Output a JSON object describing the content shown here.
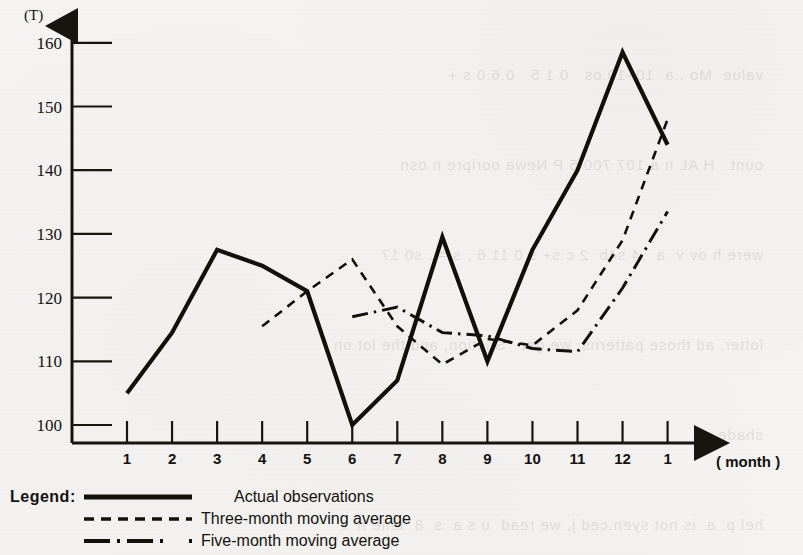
{
  "chart_data": {
    "type": "line",
    "title": "",
    "unit_label": "(T)",
    "xlabel": "( month )",
    "ylabel": "",
    "ylim": [
      95,
      165
    ],
    "yticks": [
      100,
      110,
      120,
      130,
      140,
      150,
      160
    ],
    "grid": false,
    "x": [
      1,
      2,
      3,
      4,
      5,
      6,
      7,
      8,
      9,
      10,
      11,
      12,
      13
    ],
    "categories": [
      "1",
      "2",
      "3",
      "4",
      "5",
      "6",
      "7",
      "8",
      "9",
      "10",
      "11",
      "12",
      "1"
    ],
    "year_markers": [
      {
        "at_category_index": 0,
        "label": "2020"
      },
      {
        "at_category_index": 12,
        "label": "2021"
      }
    ],
    "legend_position": "below-left",
    "legend_title": "Legend:",
    "series": [
      {
        "name": "Actual observations",
        "style": "solid",
        "x": [
          1,
          2,
          3,
          4,
          5,
          6,
          7,
          8,
          9,
          10,
          11,
          12,
          13
        ],
        "values": [
          105,
          114.5,
          127.5,
          125,
          121,
          100,
          107,
          129.5,
          110,
          127.5,
          140,
          158.5,
          144
        ]
      },
      {
        "name": "Three-month moving average",
        "style": "dashed",
        "x": [
          4,
          5,
          6,
          7,
          8,
          9,
          10,
          11,
          12,
          13
        ],
        "values": [
          115.5,
          121,
          126,
          115.5,
          109.5,
          113.5,
          112.5,
          118,
          129,
          148
        ]
      },
      {
        "name": "Five-month moving average",
        "style": "dash-dot",
        "x": [
          6,
          7,
          8,
          9,
          10,
          11,
          12,
          13
        ],
        "values": [
          117,
          118.5,
          114.5,
          114,
          112,
          111.5,
          121.5,
          133.5
        ]
      }
    ]
  },
  "axis": {
    "unit": "(T)",
    "x_caption": "( month )",
    "y_tick_labels": [
      "160",
      "150",
      "140",
      "130",
      "120",
      "110",
      "100"
    ],
    "x_tick_labels": [
      "1",
      "2",
      "3",
      "4",
      "5",
      "6",
      "7",
      "8",
      "9",
      "10",
      "11",
      "12",
      "1"
    ],
    "year_start": "2020",
    "year_end": "2021"
  },
  "legend": {
    "title": "Legend:",
    "entries": [
      {
        "label": "Actual observations",
        "style": "solid"
      },
      {
        "label": "Three-month moving average",
        "style": "dashed"
      },
      {
        "label": "Five-month moving average",
        "style": "dash-dot"
      }
    ]
  }
}
